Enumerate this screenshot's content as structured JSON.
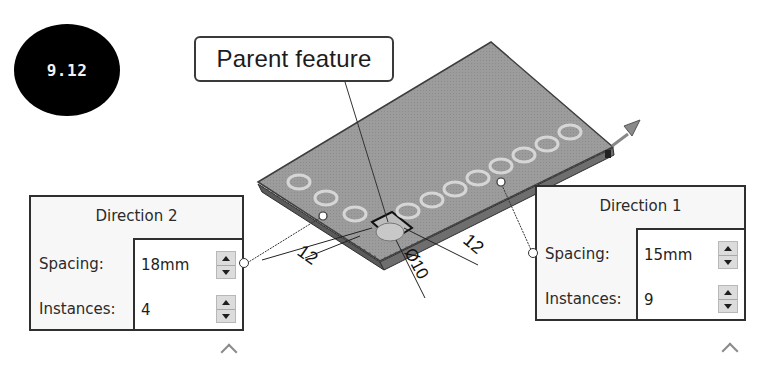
{
  "figure": {
    "badge_label": "9.12",
    "callout_label": "Parent feature"
  },
  "dimensions": {
    "left_offset": "12",
    "right_offset": "12",
    "hole_diameter": "Ø10"
  },
  "direction2": {
    "title": "Direction 2",
    "spacing_label": "Spacing:",
    "spacing_value": "18mm",
    "instances_label": "Instances:",
    "instances_value": "4",
    "collapse_icon": "chevron-up-icon"
  },
  "direction1": {
    "title": "Direction 1",
    "spacing_label": "Spacing:",
    "spacing_value": "15mm",
    "instances_label": "Instances:",
    "instances_value": "9",
    "collapse_icon": "chevron-up-icon"
  },
  "pattern": {
    "direction1_instances": 9,
    "direction2_instances": 4
  },
  "colors": {
    "plate_fill": "#9a9a9a",
    "plate_edge": "#3d3d3d",
    "hole_ring": "#d4d4d4",
    "badge_bg": "#000000",
    "box_border": "#2f2f2f"
  }
}
